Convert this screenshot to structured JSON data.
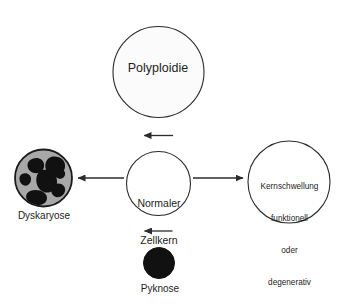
{
  "diagram": {
    "title_text": "Normaler Zellkern",
    "background_color": "#ffffff",
    "stroke_color": "#2b2b2b",
    "text_color": "#1d1d1d",
    "nodes": {
      "center": {
        "name": "Normaler Zellkern",
        "line1": "Normaler",
        "line2": "Zellkern",
        "shape": "circle-outline",
        "fill": "#ffffff"
      },
      "top": {
        "name": "Polyploidie",
        "label": "Polyploidie",
        "shape": "circle-outline",
        "fill": "#fbfbfb"
      },
      "right": {
        "name": "Kernschwellung",
        "line1": "Kernschwellung",
        "line2": "funktionell",
        "line3": "oder",
        "line4": "degenerativ",
        "shape": "circle-outline",
        "fill": "#ffffff"
      },
      "left": {
        "name": "Dyskaryose",
        "label": "Dyskaryose",
        "shape": "circle-gray-with-black-blobs",
        "fill": "#a8a8a8",
        "blob_fill": "#111111"
      },
      "bottom": {
        "name": "Pyknose",
        "label": "Pyknose",
        "shape": "circle-solid-black",
        "fill": "#111111"
      }
    },
    "arrows": [
      {
        "name": "arrow-center-to-top",
        "from": "center",
        "to": "top",
        "direction": "up"
      },
      {
        "name": "arrow-center-to-left",
        "from": "center",
        "to": "left",
        "direction": "left"
      },
      {
        "name": "arrow-center-to-right",
        "from": "center",
        "to": "right",
        "direction": "right"
      },
      {
        "name": "arrow-center-to-bottom",
        "from": "center",
        "to": "bottom",
        "direction": "down"
      }
    ]
  }
}
